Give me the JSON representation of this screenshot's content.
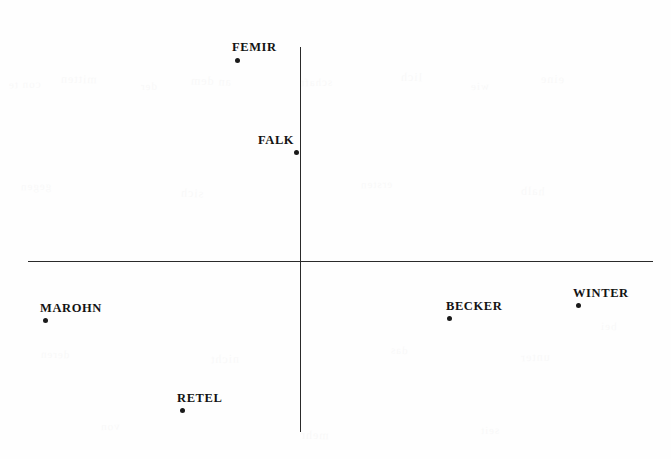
{
  "chart_data": {
    "type": "scatter",
    "title": "",
    "subtitle": "",
    "xlabel": "",
    "ylabel": "",
    "grid": false,
    "legend": "none",
    "axes": {
      "style": "crossed-center-axes",
      "origin_px": [
        300,
        261
      ],
      "x_axis_px": {
        "x1": 28,
        "x2": 653,
        "y": 261
      },
      "y_axis_px": {
        "y1": 47,
        "y2": 432,
        "x": 300
      },
      "x_tick_labels": [],
      "y_tick_labels": []
    },
    "points": [
      {
        "label": "FEMIR",
        "px": [
          237,
          60
        ],
        "label_px": [
          232,
          40
        ],
        "x": -0.101,
        "y": 1.045
      },
      {
        "label": "FALK",
        "px": [
          296,
          152
        ],
        "label_px": [
          258,
          133
        ],
        "x": -0.006,
        "y": 0.566
      },
      {
        "label": "MAROHN",
        "px": [
          45,
          320
        ],
        "label_px": [
          40,
          301
        ],
        "x": -0.408,
        "y": -0.307
      },
      {
        "label": "RETEL",
        "px": [
          182,
          410
        ],
        "label_px": [
          177,
          391
        ],
        "x": -0.189,
        "y": -0.775
      },
      {
        "label": "BECKER",
        "px": [
          449,
          318
        ],
        "label_px": [
          446,
          299
        ],
        "x": 0.238,
        "y": -0.296
      },
      {
        "label": "WINTER",
        "px": [
          578,
          305
        ],
        "label_px": [
          573,
          286
        ],
        "x": 0.445,
        "y": -0.229
      }
    ]
  },
  "artifacts": {
    "ghosts": [
      {
        "text": "con te",
        "px": [
          8,
          78
        ],
        "size": 11,
        "rot": -2
      },
      {
        "text": "mitten",
        "px": [
          60,
          72
        ],
        "size": 12,
        "rot": 1
      },
      {
        "text": "der",
        "px": [
          140,
          80
        ],
        "size": 11,
        "rot": -1
      },
      {
        "text": "an dem",
        "px": [
          190,
          74
        ],
        "size": 12,
        "rot": 2
      },
      {
        "text": "schaft",
        "px": [
          300,
          76
        ],
        "size": 11,
        "rot": -1
      },
      {
        "text": "lich",
        "px": [
          400,
          70
        ],
        "size": 12,
        "rot": 1
      },
      {
        "text": "wie",
        "px": [
          470,
          80
        ],
        "size": 11,
        "rot": -2
      },
      {
        "text": "eine",
        "px": [
          540,
          72
        ],
        "size": 12,
        "rot": 1
      },
      {
        "text": "gegen",
        "px": [
          20,
          180
        ],
        "size": 11,
        "rot": -1
      },
      {
        "text": "sich",
        "px": [
          180,
          186
        ],
        "size": 12,
        "rot": 2
      },
      {
        "text": "ersten",
        "px": [
          360,
          178
        ],
        "size": 11,
        "rot": -1
      },
      {
        "text": "halb",
        "px": [
          520,
          184
        ],
        "size": 12,
        "rot": 1
      },
      {
        "text": "deren",
        "px": [
          40,
          348
        ],
        "size": 11,
        "rot": 1
      },
      {
        "text": "nicht",
        "px": [
          210,
          352
        ],
        "size": 12,
        "rot": -1
      },
      {
        "text": "das",
        "px": [
          390,
          344
        ],
        "size": 11,
        "rot": 2
      },
      {
        "text": "unter",
        "px": [
          520,
          350
        ],
        "size": 12,
        "rot": -1
      },
      {
        "text": "bei",
        "px": [
          600,
          320
        ],
        "size": 11,
        "rot": 1
      },
      {
        "text": "von",
        "px": [
          100,
          420
        ],
        "size": 11,
        "rot": -2
      },
      {
        "text": "mehr",
        "px": [
          300,
          428
        ],
        "size": 12,
        "rot": 1
      },
      {
        "text": "seit",
        "px": [
          480,
          424
        ],
        "size": 11,
        "rot": -1
      }
    ]
  }
}
